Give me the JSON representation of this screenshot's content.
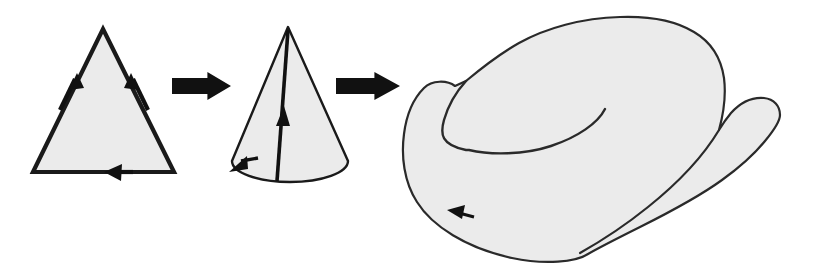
{
  "figure": {
    "canvas": {
      "width": 825,
      "height": 269,
      "background": "#ffffff"
    },
    "style": {
      "fill": "#ebebeb",
      "stroke": "#1a1a1a",
      "arrow_fill": "#111111",
      "thin_stroke_width": 1.6,
      "thick_stroke_width": 4.2
    },
    "stages": [
      {
        "id": "triangle",
        "label": "triangle",
        "shape": "triangle",
        "vertices": [
          [
            103,
            29
          ],
          [
            174,
            172
          ],
          [
            33,
            172
          ]
        ],
        "edge_arrows": [
          {
            "id": "left-edge-arrow",
            "direction": "up-right",
            "at": [
              72,
              85
            ]
          },
          {
            "id": "right-edge-arrow",
            "direction": "up-left",
            "at": [
              137,
              85
            ]
          },
          {
            "id": "bottom-edge-arrow",
            "direction": "left",
            "at": [
              116,
              172
            ]
          }
        ]
      },
      {
        "id": "cone",
        "label": "cone",
        "shape": "cone",
        "apex": [
          288,
          27
        ],
        "base_center": [
          290,
          161
        ],
        "base_rx": 58,
        "base_ry": 21,
        "seam_arrow": {
          "id": "cone-seam-arrow",
          "direction": "up",
          "at": [
            281,
            113
          ]
        },
        "base_arrow": {
          "id": "cone-base-arrow",
          "direction": "down-left",
          "at": [
            238,
            163
          ]
        }
      },
      {
        "id": "dunce-hat",
        "label": "dunce hat",
        "shape": "dunce-hat",
        "boundary_arrow": {
          "id": "dunce-hat-edge-arrow",
          "direction": "left",
          "at": [
            456,
            214
          ]
        }
      }
    ],
    "connectors": [
      {
        "id": "arrow-1",
        "from": "triangle",
        "to": "cone",
        "direction": "right",
        "x": 172,
        "y": 72,
        "width": 59,
        "height": 28
      },
      {
        "id": "arrow-2",
        "from": "cone",
        "to": "dunce-hat",
        "direction": "right",
        "x": 336,
        "y": 72,
        "width": 64,
        "height": 28
      }
    ]
  }
}
